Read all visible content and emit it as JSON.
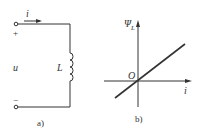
{
  "figure_a": {
    "caption": "a)",
    "current_label": "i",
    "voltage_label": "u",
    "inductor_label": "L",
    "plus_sign": "+",
    "minus_sign": "−"
  },
  "figure_b": {
    "caption": "b)",
    "y_axis_label": "Ψ",
    "y_axis_subscript": "L",
    "x_axis_label": "i",
    "origin_label": "O"
  },
  "colors": {
    "stroke": "#333333",
    "background": "#ffffff"
  }
}
